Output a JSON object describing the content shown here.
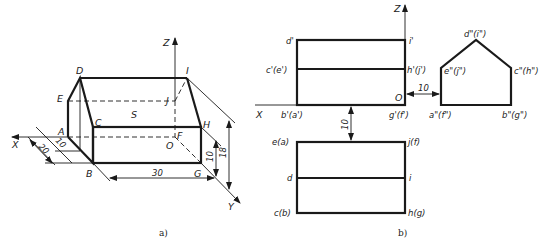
{
  "figure_a": {
    "caption": "a)",
    "axes": {
      "x": "X",
      "y": "Y",
      "z": "Z",
      "origin": "O"
    },
    "vertices": {
      "A": "A",
      "B": "B",
      "C": "C",
      "D": "D",
      "E": "E",
      "F": "F",
      "G": "G",
      "H": "H",
      "I": "I",
      "J": "J"
    },
    "face_label": "S",
    "dimensions": {
      "width_20": "20",
      "offset_10": "10",
      "length_30": "30",
      "height_10": "10",
      "height_18": "18"
    }
  },
  "figure_b": {
    "caption": "b)",
    "axes": {
      "x": "X",
      "z": "Z",
      "origin": "O"
    },
    "front_view": {
      "top_left": "d'",
      "top_right": "i'",
      "mid_left": "c'(e')",
      "mid_right": "h'(j')",
      "bottom_left": "b'(a')",
      "bottom_right": "g'(f')"
    },
    "side_view": {
      "apex": "d\"(i\")",
      "left_shoulder": "e\"(j\")",
      "right_shoulder": "c\"(h\")",
      "bottom_left": "a\"(f\")",
      "bottom_right": "b\"(g\")"
    },
    "top_view": {
      "top_left": "e(a)",
      "top_right": "j(f)",
      "mid_left": "d",
      "mid_right": "i",
      "bottom_left": "c(b)",
      "bottom_right": "h(g)"
    },
    "dimensions": {
      "gap_side": "10",
      "gap_top": "10"
    }
  }
}
